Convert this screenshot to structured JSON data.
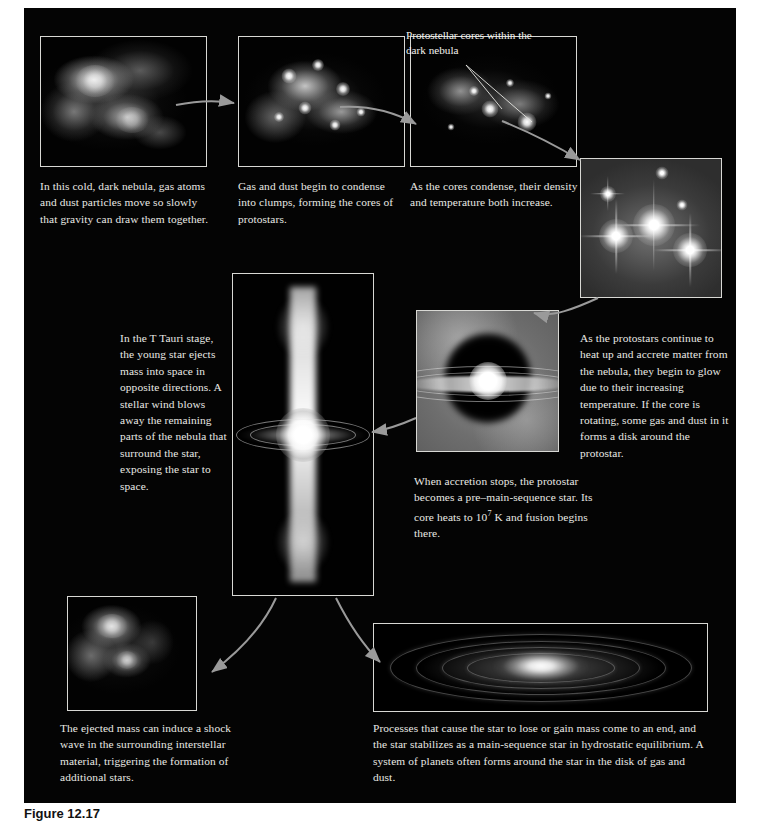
{
  "figure": {
    "caption_label": "Figure 12.17",
    "background_color": "#040404",
    "panel_border_color": "#d8d8d4",
    "text_color": "#e9e9e5",
    "arrow_color": "#9a9a9a"
  },
  "stages": [
    {
      "id": "dark-nebula",
      "caption": "In this cold, dark nebula, gas atoms and dust particles move so slowly that gravity can draw them together."
    },
    {
      "id": "condensing-clumps",
      "caption": "Gas and dust begin to condense into clumps, forming the cores of protostars."
    },
    {
      "id": "core-density",
      "caption": "As the cores condense, their density and temperature both increase.",
      "inset_label": "Protostellar cores within the dark nebula"
    },
    {
      "id": "glowing-protostars",
      "caption": "As the protostars continue to heat up and accrete matter from the nebula, they begin to glow due to their increasing temperature. If the core is rotating, some gas and dust in it forms a disk around the protostar."
    },
    {
      "id": "pre-main-sequence",
      "caption_part1": "When accretion stops, the protostar becomes a pre–main-sequence star. Its core heats to 10",
      "caption_exponent": "7",
      "caption_part2": " K and fusion begins there."
    },
    {
      "id": "t-tauri",
      "caption": "In the T Tauri stage, the young star ejects mass into space in opposite directions. A stellar wind blows away the remaining parts of the nebula that surround the star, exposing the star to space."
    },
    {
      "id": "shock-wave",
      "caption": "The ejected mass can induce a shock wave in the surrounding interstellar material, triggering the formation of additional stars."
    },
    {
      "id": "main-sequence-disk",
      "caption": "Processes that cause the star to lose or gain mass come to an end, and the star stabilizes as a main-sequence star in hydrostatic equilibrium. A system of planets often forms around the star in the disk of gas and dust."
    }
  ]
}
